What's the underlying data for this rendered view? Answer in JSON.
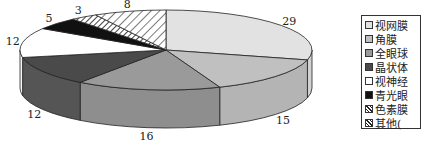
{
  "chart_data": {
    "type": "pie",
    "style": "3d-exploded-none",
    "title": "",
    "start": "top",
    "direction": "clockwise",
    "slices": [
      {
        "label": "视网膜",
        "value": 29,
        "fill": "#e2e2e2",
        "side": "#d2d2d2",
        "pattern": "solid"
      },
      {
        "label": "角膜",
        "value": 15,
        "fill": "#c0c0c0",
        "side": "#b4b4b4",
        "pattern": "solid"
      },
      {
        "label": "全眼球",
        "value": 16,
        "fill": "#9a9a9a",
        "side": "#8e8e8e",
        "pattern": "solid"
      },
      {
        "label": "晶状体",
        "value": 12,
        "fill": "#4a4a4a",
        "side": "#555555",
        "pattern": "solid"
      },
      {
        "label": "视神经",
        "value": 12,
        "fill": "#ffffff",
        "side": "#f4f4f4",
        "pattern": "solid"
      },
      {
        "label": "青光眼",
        "value": 5,
        "fill": "#111111",
        "side": "#111111",
        "pattern": "solid"
      },
      {
        "label": "色素膜",
        "value": 3,
        "fill": "#ffffff",
        "side": "#ffffff",
        "pattern": "hatch-dense"
      },
      {
        "label": "其他(",
        "value": 8,
        "fill": "#ffffff",
        "side": "#ffffff",
        "pattern": "hatch"
      }
    ],
    "legend_position": "right",
    "legend_truncated": true
  }
}
